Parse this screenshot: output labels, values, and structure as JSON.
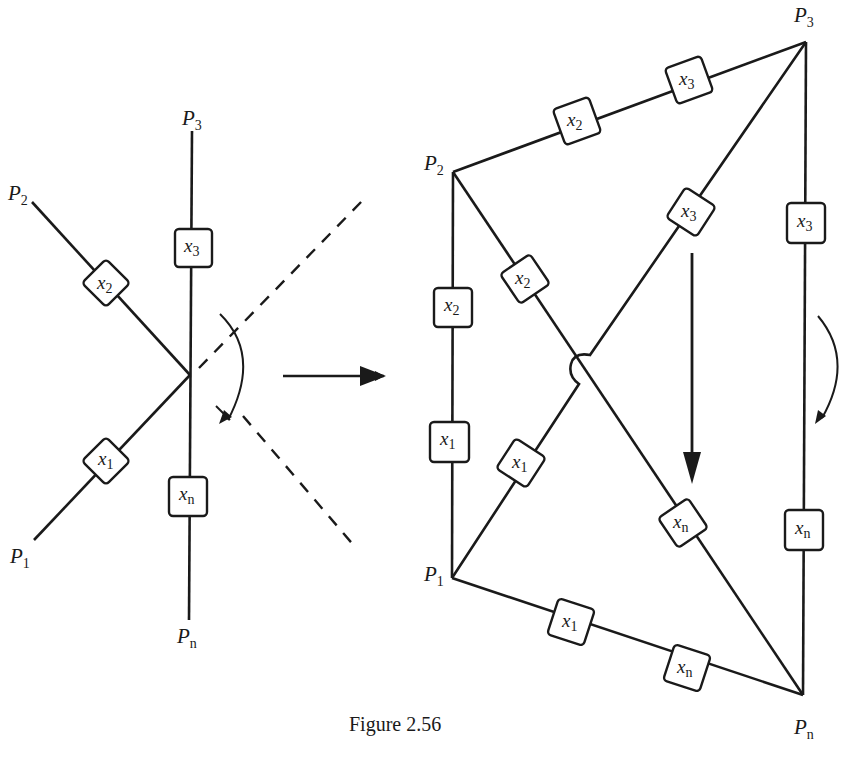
{
  "figure": {
    "caption": "Figure 2.56",
    "colors": {
      "ink": "#1a1a1a",
      "background": "#ffffff"
    }
  },
  "star": {
    "nodes": [
      {
        "id": "P2",
        "base": "P",
        "sub": "2"
      },
      {
        "id": "P3",
        "base": "P",
        "sub": "3"
      },
      {
        "id": "P1",
        "base": "P",
        "sub": "1"
      },
      {
        "id": "Pn",
        "base": "P",
        "sub": "n"
      }
    ],
    "boxes": [
      {
        "base": "x",
        "sub": "2"
      },
      {
        "base": "x",
        "sub": "3"
      },
      {
        "base": "x",
        "sub": "1"
      },
      {
        "base": "x",
        "sub": "n"
      }
    ]
  },
  "mesh": {
    "nodes": [
      {
        "id": "P2",
        "base": "P",
        "sub": "2"
      },
      {
        "id": "P3",
        "base": "P",
        "sub": "3"
      },
      {
        "id": "P1",
        "base": "P",
        "sub": "1"
      },
      {
        "id": "Pn",
        "base": "P",
        "sub": "n"
      }
    ],
    "edges": [
      {
        "from": "P2",
        "to": "P3",
        "boxes": [
          {
            "base": "x",
            "sub": "2"
          },
          {
            "base": "x",
            "sub": "3"
          }
        ]
      },
      {
        "from": "P2",
        "to": "P1",
        "boxes": [
          {
            "base": "x",
            "sub": "2"
          },
          {
            "base": "x",
            "sub": "1"
          }
        ]
      },
      {
        "from": "P2",
        "to": "Pn",
        "boxes": [
          {
            "base": "x",
            "sub": "2"
          },
          {
            "base": "x",
            "sub": "n"
          }
        ]
      },
      {
        "from": "P1",
        "to": "P3",
        "boxes": [
          {
            "base": "x",
            "sub": "1"
          },
          {
            "base": "x",
            "sub": "3"
          }
        ]
      },
      {
        "from": "P3",
        "to": "Pn",
        "boxes": [
          {
            "base": "x",
            "sub": "3"
          },
          {
            "base": "x",
            "sub": "n"
          }
        ]
      },
      {
        "from": "P1",
        "to": "Pn",
        "boxes": [
          {
            "base": "x",
            "sub": "1"
          },
          {
            "base": "x",
            "sub": "n"
          }
        ]
      }
    ]
  }
}
